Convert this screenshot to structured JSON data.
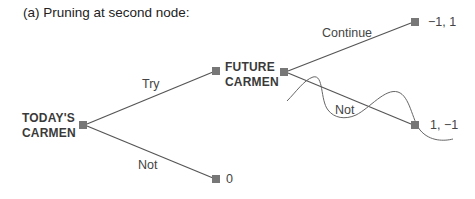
{
  "figure": {
    "title": "(a) Pruning at second node:"
  },
  "nodes": {
    "today": {
      "line1": "TODAY'S",
      "line2": "CARMEN"
    },
    "future": {
      "line1": "FUTURE",
      "line2": "CARMEN"
    }
  },
  "edges": {
    "try": "Try",
    "not_first": "Not",
    "continue": "Continue",
    "not_second": "Not"
  },
  "payoffs": {
    "continue": "−1, 1",
    "not_second": "1, −1",
    "not_first": "0"
  },
  "colors": {
    "node_fill": "#777777",
    "line": "#555555",
    "prune_curve": "#666666"
  }
}
